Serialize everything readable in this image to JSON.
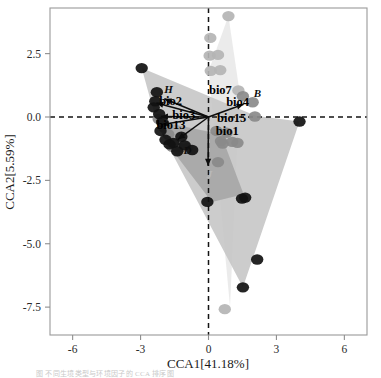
{
  "figure": {
    "type": "cca-ordination-biplot",
    "caption_fragment": "图 不同生境类型与环境因子的 CCA 排序图"
  },
  "axes": {
    "x_title": "CCA1[41.18%]",
    "y_title": "CCA2[5.59%]",
    "x_ticks": [
      "-6",
      "-3",
      "0",
      "3",
      "6"
    ],
    "y_ticks": [
      "2.5",
      "0.0",
      "-2.5",
      "-5.0",
      "-7.5"
    ],
    "x_tick_values": [
      -6,
      -3,
      0,
      3,
      6
    ],
    "y_tick_values": [
      2.5,
      0.0,
      -2.5,
      -5.0,
      -7.5
    ],
    "xlim": [
      -7.0,
      7.0
    ],
    "ylim": [
      -8.6,
      4.3
    ],
    "zero_lines": true,
    "grid": false
  },
  "colors": {
    "dark_point": "#111111",
    "mid_point": "#8a8a8a",
    "light_point": "#b4b4b4",
    "polygon_light": "#e9e9e9",
    "polygon_mid": "#c6c6c6",
    "polygon_dark": "#a6a6a6",
    "frame": "#9a9a9a",
    "arrow": "#0d0d0d",
    "text": "#1a1a1a"
  },
  "chart_data": {
    "type": "scatter",
    "title": "",
    "subtitle": "",
    "xlabel": "CCA1[41.18%]",
    "ylabel": "CCA2[5.59%]",
    "xlim": [
      -7.0,
      7.0
    ],
    "ylim": [
      -8.6,
      4.3
    ],
    "grid": false,
    "legend_position": "none",
    "series": [
      {
        "name": "dark-sites",
        "color": "#111111",
        "marker": "circle",
        "points": [
          {
            "x": -2.95,
            "y": 1.93
          },
          {
            "x": -2.35,
            "y": 0.62
          },
          {
            "x": -2.42,
            "y": 0.38
          },
          {
            "x": -2.28,
            "y": 0.98
          },
          {
            "x": -2.18,
            "y": 0.12
          },
          {
            "x": -2.05,
            "y": -0.2
          },
          {
            "x": -2.12,
            "y": -0.55
          },
          {
            "x": -1.9,
            "y": -0.9
          },
          {
            "x": -1.72,
            "y": -1.08
          },
          {
            "x": -1.55,
            "y": -1.02
          },
          {
            "x": -1.38,
            "y": -1.35
          },
          {
            "x": -1.2,
            "y": -0.78
          },
          {
            "x": -1.05,
            "y": -1.12
          },
          {
            "x": -0.72,
            "y": -1.3
          },
          {
            "x": 4.02,
            "y": -0.18
          },
          {
            "x": 1.48,
            "y": -3.22
          },
          {
            "x": -0.05,
            "y": -3.35
          },
          {
            "x": 1.62,
            "y": -3.18
          },
          {
            "x": 2.15,
            "y": -5.62
          },
          {
            "x": 1.52,
            "y": -6.72
          }
        ]
      },
      {
        "name": "mid-gray-sites",
        "color": "#8a8a8a",
        "marker": "circle",
        "points": [
          {
            "x": -2.2,
            "y": -0.08
          },
          {
            "x": -1.95,
            "y": -0.42
          },
          {
            "x": -1.78,
            "y": -0.68
          },
          {
            "x": -1.6,
            "y": -1.18
          },
          {
            "x": -1.3,
            "y": -1.2
          },
          {
            "x": -0.95,
            "y": -1.22
          },
          {
            "x": 0.35,
            "y": -0.55
          },
          {
            "x": 0.55,
            "y": -0.95
          },
          {
            "x": 0.8,
            "y": -0.62
          },
          {
            "x": 1.05,
            "y": -0.98
          },
          {
            "x": 1.28,
            "y": -1.02
          },
          {
            "x": 1.52,
            "y": 0.82
          },
          {
            "x": 1.95,
            "y": 0.58
          },
          {
            "x": 2.05,
            "y": 0.02
          },
          {
            "x": 0.42,
            "y": -1.78
          },
          {
            "x": 0.62,
            "y": -1.05
          }
        ]
      },
      {
        "name": "light-gray-sites",
        "color": "#b4b4b4",
        "marker": "circle",
        "points": [
          {
            "x": 0.88,
            "y": 3.98
          },
          {
            "x": 0.08,
            "y": 3.12
          },
          {
            "x": 0.05,
            "y": 2.42
          },
          {
            "x": 0.42,
            "y": 2.45
          },
          {
            "x": 0.1,
            "y": 1.82
          },
          {
            "x": 0.52,
            "y": 1.85
          },
          {
            "x": 1.32,
            "y": 1.05
          },
          {
            "x": 0.72,
            "y": -7.58
          }
        ]
      }
    ],
    "vectors": [
      {
        "label": "bio7",
        "x": -1.95,
        "y": 0.72
      },
      {
        "label": "bio2",
        "x": -2.3,
        "y": 0.55
      },
      {
        "label": "bio3",
        "x": -2.1,
        "y": 0.02
      },
      {
        "label": "bio13",
        "x": -2.05,
        "y": -0.3
      },
      {
        "label": "bio15",
        "x": -1.35,
        "y": -0.88
      },
      {
        "label": "bio4",
        "x": 1.55,
        "y": 0.5
      },
      {
        "label": "bio1",
        "x": -0.02,
        "y": -1.92
      }
    ],
    "vector_label_positions": [
      {
        "label": "bio7",
        "x": 0.02,
        "y": 0.92
      },
      {
        "label": "bio2",
        "x": -2.18,
        "y": 0.48
      },
      {
        "label": "bio3",
        "x": -1.6,
        "y": -0.06
      },
      {
        "label": "bio13",
        "x": -2.3,
        "y": -0.48
      },
      {
        "label": "bio15",
        "x": 0.38,
        "y": -0.18
      },
      {
        "label": "bio4",
        "x": 0.78,
        "y": 0.42
      },
      {
        "label": "bio1",
        "x": 0.32,
        "y": -0.72
      }
    ],
    "group_labels": [
      {
        "label": "H",
        "x": -1.95,
        "y": 0.95
      },
      {
        "label": "B",
        "x": 2.0,
        "y": 0.78
      },
      {
        "label": "D",
        "x": -1.1,
        "y": -1.45
      },
      {
        "label": "J",
        "x": -0.08,
        "y": -2.42
      }
    ],
    "polygons": [
      {
        "name": "light-polygon",
        "fill": "#e9e9e9",
        "vertices": [
          {
            "x": 0.88,
            "y": 3.98
          },
          {
            "x": 1.38,
            "y": 0.95
          },
          {
            "x": 0.95,
            "y": -7.48
          },
          {
            "x": 0.28,
            "y": -1.05
          },
          {
            "x": 0.02,
            "y": 1.85
          }
        ]
      },
      {
        "name": "mid-polygon",
        "fill": "#c6c6c6",
        "vertices": [
          {
            "x": -2.95,
            "y": 1.93
          },
          {
            "x": 2.08,
            "y": 0.05
          },
          {
            "x": 4.02,
            "y": -0.18
          },
          {
            "x": 1.52,
            "y": -6.72
          },
          {
            "x": -2.25,
            "y": -0.35
          }
        ]
      },
      {
        "name": "dark-polygon",
        "fill": "#a6a6a6",
        "vertices": [
          {
            "x": -2.3,
            "y": -0.15
          },
          {
            "x": 0.55,
            "y": -0.68
          },
          {
            "x": 1.55,
            "y": -3.05
          },
          {
            "x": 0.15,
            "y": -3.35
          },
          {
            "x": -1.65,
            "y": -1.25
          }
        ]
      }
    ]
  }
}
